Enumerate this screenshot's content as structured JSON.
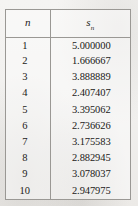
{
  "table": {
    "columns": [
      {
        "key": "n",
        "symbol": "n",
        "subscript": ""
      },
      {
        "key": "s_n",
        "symbol": "s",
        "subscript": "n"
      }
    ],
    "rows": [
      {
        "n": "1",
        "s_n": "5.000000"
      },
      {
        "n": "2",
        "s_n": "1.666667"
      },
      {
        "n": "3",
        "s_n": "3.888889"
      },
      {
        "n": "4",
        "s_n": "2.407407"
      },
      {
        "n": "5",
        "s_n": "3.395062"
      },
      {
        "n": "6",
        "s_n": "2.736626"
      },
      {
        "n": "7",
        "s_n": "3.175583"
      },
      {
        "n": "8",
        "s_n": "2.882945"
      },
      {
        "n": "9",
        "s_n": "3.078037"
      },
      {
        "n": "10",
        "s_n": "2.947975"
      }
    ]
  },
  "style": {
    "border_color": "#9a9894",
    "text_color": "#1b1a18",
    "paper_color": "#f3f2f0"
  }
}
